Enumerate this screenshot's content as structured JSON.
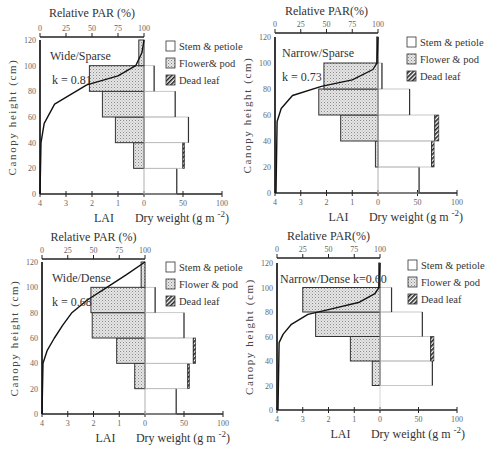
{
  "chart_data": [
    {
      "type": "bar",
      "title": "Wide/Sparse",
      "annotation": "k = 0.81",
      "ylabel": "Canopy height (cm)",
      "xlabel_left": "LAI",
      "xlabel_right": "Dry weight (g m-2)",
      "top_axis_label": "Relative PAR (%)",
      "ylim": [
        0,
        120
      ],
      "lai_ticks": [
        "4",
        "3",
        "2",
        "1",
        "0"
      ],
      "dw_ticks": [
        "50",
        "100"
      ],
      "par_ticks": [
        "0",
        "25",
        "50",
        "75",
        "100"
      ],
      "y_ticks": [
        "0",
        "20",
        "40",
        "60",
        "80",
        "100",
        "120"
      ],
      "categories": [
        "0-20",
        "20-40",
        "40-60",
        "60-80",
        "80-100",
        "100-120"
      ],
      "series": [
        {
          "name": "LAI",
          "values": [
            0,
            0.4,
            1.1,
            1.6,
            2.1,
            0.2
          ]
        },
        {
          "name": "Stem & petiole",
          "values": [
            42,
            50,
            57,
            40,
            13,
            0
          ]
        },
        {
          "name": "Flower & pod",
          "values": [
            0,
            0,
            0,
            0,
            0,
            0
          ]
        },
        {
          "name": "Dead leaf",
          "values": [
            0,
            2,
            0,
            0,
            0,
            0
          ]
        }
      ],
      "par_curve": {
        "height": [
          0,
          40,
          55,
          70,
          85,
          92,
          100,
          110,
          120
        ],
        "par": [
          0,
          1,
          4,
          14,
          45,
          75,
          92,
          98,
          100
        ]
      }
    },
    {
      "type": "bar",
      "title": "Narrow/Sparse",
      "annotation": "k = 0.73",
      "ylabel": "Canopy height (cm)",
      "xlabel_left": "LAI",
      "xlabel_right": "Dry weight (g m-2)",
      "top_axis_label": "Relative PAR(%)",
      "ylim": [
        0,
        120
      ],
      "lai_ticks": [
        "4",
        "3",
        "2",
        "1",
        "0"
      ],
      "dw_ticks": [
        "50",
        "100"
      ],
      "par_ticks": [
        "0",
        "25",
        "50",
        "75",
        "100"
      ],
      "y_ticks": [
        "0",
        "20",
        "40",
        "60",
        "80",
        "100",
        "120"
      ],
      "categories": [
        "0-20",
        "20-40",
        "40-60",
        "60-80",
        "80-100",
        "100-120"
      ],
      "series": [
        {
          "name": "LAI",
          "values": [
            0,
            0.1,
            1.45,
            2.3,
            2.1,
            0.05
          ]
        },
        {
          "name": "Stem & petiole",
          "values": [
            52,
            68,
            72,
            40,
            5,
            0
          ]
        },
        {
          "name": "Flower & pod",
          "values": [
            0,
            0,
            0,
            0,
            0,
            0
          ]
        },
        {
          "name": "Dead leaf",
          "values": [
            0,
            3,
            5,
            0,
            0,
            0
          ]
        }
      ],
      "par_curve": {
        "height": [
          0,
          55,
          65,
          75,
          82,
          87,
          95,
          100,
          120
        ],
        "par": [
          1,
          2,
          6,
          17,
          45,
          75,
          95,
          99,
          100
        ]
      }
    },
    {
      "type": "bar",
      "title": "Wide/Dense",
      "annotation": "k = 0.68",
      "ylabel": "Canopy height (cm)",
      "xlabel_left": "LAI",
      "xlabel_right": "Dry weight (g m-2)",
      "top_axis_label": "Relative PAR (%)",
      "ylim": [
        0,
        120
      ],
      "lai_ticks": [
        "4",
        "3",
        "2",
        "1",
        "0"
      ],
      "dw_ticks": [
        "50",
        "100"
      ],
      "par_ticks": [
        "0",
        "25",
        "50",
        "75",
        "100"
      ],
      "y_ticks": [
        "0",
        "20",
        "40",
        "60",
        "80",
        "100",
        "120"
      ],
      "categories": [
        "0-20",
        "20-40",
        "40-60",
        "60-80",
        "80-100",
        "100-120"
      ],
      "series": [
        {
          "name": "LAI",
          "values": [
            0,
            0.4,
            1.1,
            2.05,
            2.1,
            0.15
          ]
        },
        {
          "name": "Stem & petiole",
          "values": [
            40,
            55,
            62,
            50,
            13,
            0
          ]
        },
        {
          "name": "Flower & pod",
          "values": [
            0,
            0,
            0,
            0,
            0,
            0
          ]
        },
        {
          "name": "Dead leaf",
          "values": [
            0,
            2,
            3,
            0,
            0,
            0
          ]
        }
      ],
      "par_curve": {
        "height": [
          0,
          40,
          50,
          60,
          70,
          80,
          90,
          100,
          110,
          120
        ],
        "par": [
          0,
          1,
          5,
          12,
          20,
          29,
          44,
          63,
          82,
          100
        ]
      }
    },
    {
      "type": "bar",
      "title": "Narrow/Dense",
      "annotation": "k=0.60",
      "ylabel": "Canopy height (cm)",
      "xlabel_left": "LAI",
      "xlabel_right": "Dry weight (g m-2)",
      "top_axis_label": "Relative PAR(%)",
      "ylim": [
        0,
        120
      ],
      "lai_ticks": [
        "4",
        "3",
        "2",
        "1",
        "0"
      ],
      "dw_ticks": [
        "50",
        "100"
      ],
      "par_ticks": [
        "0",
        "25",
        "50",
        "75",
        "100"
      ],
      "y_ticks": [
        "0",
        "20",
        "40",
        "60",
        "80",
        "100",
        "120"
      ],
      "categories": [
        "0-20",
        "20-40",
        "40-60",
        "60-80",
        "80-100",
        "100-120"
      ],
      "series": [
        {
          "name": "LAI",
          "values": [
            0,
            0.3,
            1.15,
            2.5,
            3.0,
            0.05
          ]
        },
        {
          "name": "Stem & petiole",
          "values": [
            0,
            68,
            66,
            55,
            15,
            0
          ]
        },
        {
          "name": "Flower & pod",
          "values": [
            0,
            0,
            0,
            0,
            0,
            0
          ]
        },
        {
          "name": "Dead leaf",
          "values": [
            0,
            0,
            4,
            0,
            0,
            0
          ]
        }
      ],
      "par_curve": {
        "height": [
          0,
          55,
          62,
          70,
          78,
          82,
          88,
          95,
          100,
          120
        ],
        "par": [
          1,
          2,
          6,
          14,
          30,
          50,
          80,
          95,
          99,
          100
        ]
      }
    }
  ],
  "legend": {
    "stem": "Stem & petiole",
    "flower_tl": "Flower& pod",
    "flower": "Flower & pod",
    "dead": "Dead leaf"
  },
  "panels": [
    {
      "title": "Wide/Sparse",
      "k": "k = 0.81",
      "top": "Relative PAR (%)"
    },
    {
      "title": "Narrow/Sparse",
      "k": "k = 0.73",
      "top": "Relative PAR(%)"
    },
    {
      "title": "Wide/Dense",
      "k": "k = 0.68",
      "top": "Relative PAR (%)"
    },
    {
      "title": "Narrow/Dense k=0.60",
      "k": "",
      "top": "Relative PAR(%)"
    }
  ],
  "axis": {
    "ylabel": "Canopy height (cm)",
    "lai": "LAI",
    "dw": "Dry weight (g m",
    "dw_sup": "-2",
    "dw_close": ")"
  }
}
